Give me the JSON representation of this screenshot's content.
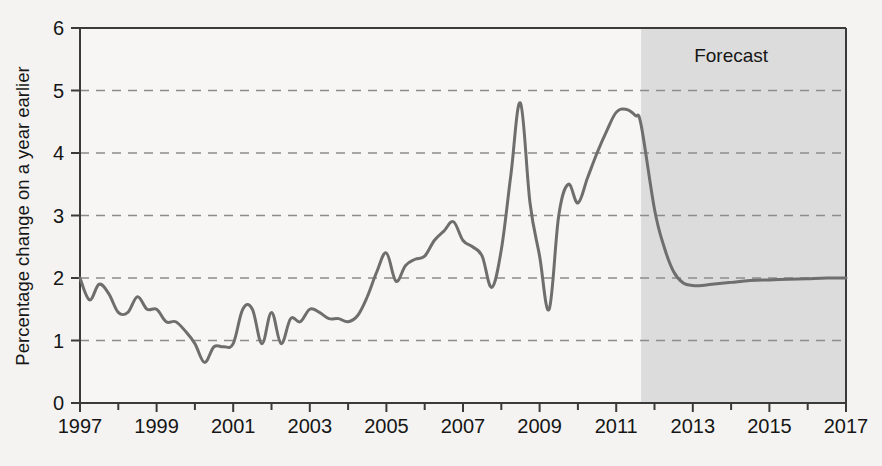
{
  "chart_data": {
    "type": "line",
    "title": "",
    "subtitle": "",
    "xlabel": "",
    "ylabel": "Percentage change on a year earlier",
    "xlim": [
      1997,
      2017
    ],
    "ylim": [
      0,
      6
    ],
    "ytick_labels": [
      "0",
      "1",
      "2",
      "3",
      "4",
      "5",
      "6"
    ],
    "ytick_values": [
      0,
      1,
      2,
      3,
      4,
      5,
      6
    ],
    "xtick_labels": [
      "1997",
      "1999",
      "2001",
      "2003",
      "2005",
      "2007",
      "2009",
      "2011",
      "2013",
      "2015",
      "2017"
    ],
    "xtick_values": [
      1997,
      1999,
      2001,
      2003,
      2005,
      2007,
      2009,
      2011,
      2013,
      2015,
      2017
    ],
    "minor_xticks_every": 1,
    "grid": "horizontal-dashed",
    "legend": "none",
    "annotations": [
      {
        "name": "forecast-label",
        "text": "Forecast",
        "x": 2014.0,
        "y": 5.45
      }
    ],
    "shaded_regions": [
      {
        "name": "forecast-region",
        "label": "Forecast",
        "x_start": 2011.65,
        "x_end": 2017,
        "color": "#dcdcdc"
      }
    ],
    "line_color": "#6e6e6e",
    "line_width": 3,
    "series": [
      {
        "name": "Percentage change on a year earlier",
        "color": "#6e6e6e",
        "x": [
          1997.0,
          1997.25,
          1997.5,
          1997.75,
          1998.0,
          1998.25,
          1998.5,
          1998.75,
          1999.0,
          1999.25,
          1999.5,
          1999.75,
          2000.0,
          2000.25,
          2000.5,
          2000.75,
          2001.0,
          2001.25,
          2001.5,
          2001.75,
          2002.0,
          2002.25,
          2002.5,
          2002.75,
          2003.0,
          2003.25,
          2003.5,
          2003.75,
          2004.0,
          2004.25,
          2004.5,
          2004.75,
          2005.0,
          2005.25,
          2005.5,
          2005.75,
          2006.0,
          2006.25,
          2006.5,
          2006.75,
          2007.0,
          2007.25,
          2007.5,
          2007.75,
          2008.0,
          2008.25,
          2008.5,
          2008.75,
          2009.0,
          2009.25,
          2009.5,
          2009.75,
          2010.0,
          2010.25,
          2010.5,
          2010.75,
          2011.0,
          2011.25,
          2011.5,
          2011.65,
          2012.0,
          2012.25,
          2012.5,
          2012.75,
          2013.0,
          2013.25,
          2013.5,
          2014.0,
          2014.5,
          2015.0,
          2015.5,
          2016.0,
          2016.5,
          2017.0
        ],
        "values": [
          2.0,
          1.65,
          1.9,
          1.75,
          1.45,
          1.45,
          1.7,
          1.5,
          1.5,
          1.3,
          1.3,
          1.15,
          0.95,
          0.65,
          0.9,
          0.9,
          0.95,
          1.5,
          1.5,
          0.95,
          1.45,
          0.95,
          1.35,
          1.3,
          1.5,
          1.45,
          1.35,
          1.35,
          1.3,
          1.4,
          1.7,
          2.1,
          2.4,
          1.95,
          2.2,
          2.3,
          2.35,
          2.6,
          2.75,
          2.9,
          2.6,
          2.5,
          2.35,
          1.85,
          2.45,
          3.65,
          4.8,
          3.2,
          2.35,
          1.5,
          3.0,
          3.5,
          3.2,
          3.6,
          4.0,
          4.35,
          4.65,
          4.7,
          4.6,
          4.45,
          3.1,
          2.5,
          2.1,
          1.92,
          1.88,
          1.88,
          1.9,
          1.93,
          1.96,
          1.97,
          1.98,
          1.99,
          2.0,
          2.0
        ]
      }
    ]
  },
  "axes": {
    "y_axis_title": "Percentage change on a year earlier"
  }
}
